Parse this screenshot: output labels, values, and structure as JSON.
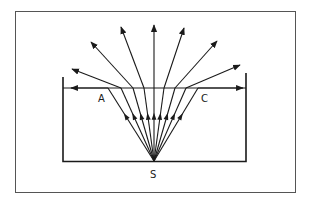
{
  "diagram": {
    "labels": {
      "left_critical_point": "A",
      "right_critical_point": "C",
      "source": "S"
    },
    "colors": {
      "ink": "#1a1a1a",
      "background": "#ffffff",
      "frame": "#555555"
    },
    "rays": [
      {
        "name": "critical-ray-left",
        "type": "critical"
      },
      {
        "name": "refracted-ray-1",
        "type": "refracted"
      },
      {
        "name": "refracted-ray-2",
        "type": "refracted"
      },
      {
        "name": "refracted-ray-3",
        "type": "refracted"
      },
      {
        "name": "normal-ray",
        "type": "refracted"
      },
      {
        "name": "refracted-ray-5",
        "type": "refracted"
      },
      {
        "name": "refracted-ray-6",
        "type": "refracted"
      },
      {
        "name": "refracted-ray-7",
        "type": "refracted"
      },
      {
        "name": "critical-ray-right",
        "type": "critical"
      }
    ]
  }
}
